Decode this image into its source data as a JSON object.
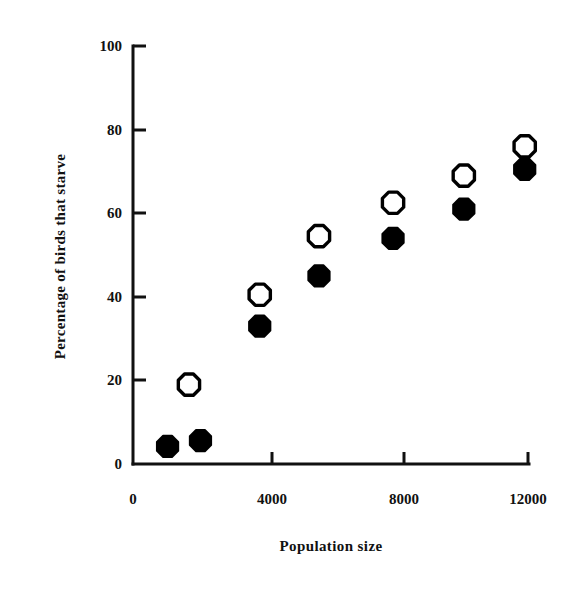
{
  "chart_data": {
    "type": "scatter",
    "title": "",
    "xlabel": "Population size",
    "ylabel": "Percentage of birds that starve",
    "xlim": [
      0,
      12000
    ],
    "ylim": [
      0,
      100
    ],
    "xticks": [
      0,
      4000,
      8000,
      12000
    ],
    "xtick_labels": [
      "0",
      "4000",
      "8000",
      "12000"
    ],
    "yticks": [
      0,
      20,
      40,
      60,
      80,
      100
    ],
    "ytick_labels": [
      "0",
      "20",
      "40",
      "60",
      "80",
      "100"
    ],
    "grid": false,
    "legend": false,
    "legend_position": "none",
    "series": [
      {
        "name": "open-markers",
        "marker": "open-octagon",
        "color": "#000000",
        "fill": "#ffffff",
        "points": [
          {
            "x": 1700,
            "y": 19.0
          },
          {
            "x": 3850,
            "y": 40.5
          },
          {
            "x": 5650,
            "y": 54.5
          },
          {
            "x": 7900,
            "y": 62.5
          },
          {
            "x": 10050,
            "y": 69.0
          },
          {
            "x": 11900,
            "y": 76.0
          }
        ]
      },
      {
        "name": "filled-markers",
        "marker": "filled-octagon",
        "color": "#000000",
        "fill": "#000000",
        "points": [
          {
            "x": 1050,
            "y": 4.2
          },
          {
            "x": 2050,
            "y": 5.6
          },
          {
            "x": 3850,
            "y": 33.0
          },
          {
            "x": 5650,
            "y": 45.0
          },
          {
            "x": 7900,
            "y": 54.0
          },
          {
            "x": 10050,
            "y": 61.0
          },
          {
            "x": 11900,
            "y": 70.5
          }
        ]
      }
    ]
  },
  "axis_style": {
    "line_color": "#111111",
    "line_width": 3,
    "tick_length": 9
  }
}
